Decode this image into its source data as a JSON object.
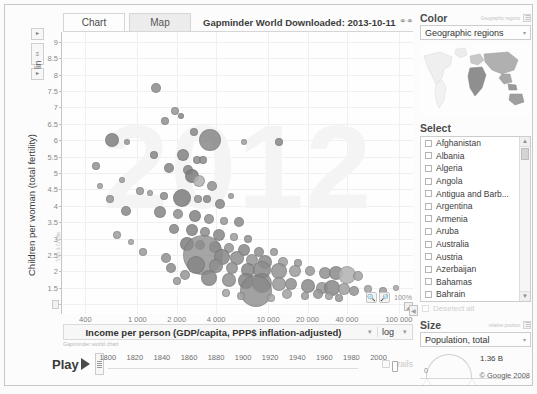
{
  "window": {
    "doc_title": "Gapminder World Downloaded: 2013-10-11",
    "link_icon": "link-icon",
    "copyright": "© Google 2008"
  },
  "tabs": [
    {
      "label": "Chart",
      "name": "tab-chart",
      "active": true
    },
    {
      "label": "Map",
      "name": "tab-map",
      "active": false
    }
  ],
  "yaxis": {
    "title": "Children per woman (total fertility)",
    "scale_label": "lin",
    "ticks": [
      "9",
      "8.5",
      "8",
      "7.5",
      "7",
      "6.5",
      "6",
      "5.5",
      "5",
      "4.5",
      "4",
      "3.5",
      "3",
      "2.5",
      "2",
      "1.5",
      "1"
    ],
    "values": [
      9,
      8.5,
      8,
      7.5,
      7,
      6.5,
      6,
      5.5,
      5,
      4.5,
      4,
      3.5,
      3,
      2.5,
      2,
      1.5,
      1
    ],
    "min": 0.7,
    "max": 9.3,
    "mini_note": "Tools & Credits"
  },
  "xaxis": {
    "title": "Income per person (GDP/capita, PPP$ inflation-adjusted)",
    "scale_label": "log",
    "ticks": [
      "400",
      "1 000",
      "2 000",
      "4 000",
      "10 000",
      "20 000",
      "40 000",
      "100 000"
    ],
    "values": [
      400,
      1000,
      2000,
      4000,
      10000,
      20000,
      40000,
      100000
    ],
    "min": 270,
    "max": 128000
  },
  "zoom_controls": {
    "zoom_in": "+",
    "zoom_out": "−",
    "level": "100%"
  },
  "timeline": {
    "play_label": "Play",
    "note": "Gapminder world chart",
    "years": [
      1800,
      1820,
      1840,
      1860,
      1880,
      1900,
      1920,
      1940,
      1960,
      1980,
      2000
    ],
    "current_year": 2012,
    "range_start": 1800,
    "range_end": 2012,
    "trails_label": "Trails",
    "trails_checked": false
  },
  "sidebar": {
    "color": {
      "title": "Color",
      "hint": "Geographic regions",
      "selected": "Geographic regions",
      "map_name": "world-map-thumbnail"
    },
    "select": {
      "title": "Select",
      "countries": [
        "Afghanistan",
        "Albania",
        "Algeria",
        "Angola",
        "Antigua and Barb...",
        "Argentina",
        "Armenia",
        "Aruba",
        "Australia",
        "Austria",
        "Azerbaijan",
        "Bahamas",
        "Bahrain"
      ],
      "deselect_label": "Deselect all"
    },
    "size": {
      "title": "Size",
      "hint": "relative position",
      "selected": "Population, total",
      "min_label": "0",
      "max_label": "1.36 B"
    }
  },
  "chart_data": {
    "type": "scatter",
    "title": "Gapminder World Downloaded: 2013-10-11",
    "xlabel": "Income per person (GDP/capita, PPP$ inflation-adjusted)",
    "ylabel": "Children per woman (total fertility)",
    "xscale": "log",
    "yscale": "linear",
    "xlim": [
      270,
      128000
    ],
    "ylim": [
      0.7,
      9.3
    ],
    "xticks": [
      400,
      1000,
      2000,
      4000,
      10000,
      20000,
      40000,
      100000
    ],
    "yticks": [
      1,
      1.5,
      2,
      2.5,
      3,
      3.5,
      4,
      4.5,
      5,
      5.5,
      6,
      6.5,
      7,
      7.5,
      8,
      8.5,
      9
    ],
    "grid": true,
    "legend": "Geographic regions",
    "size_encoding": "Population, total",
    "year": 2012,
    "watermark": "2012",
    "points": [
      {
        "x": 1400,
        "y": 7.6,
        "r": 5,
        "c": "#8f8f8f"
      },
      {
        "x": 1950,
        "y": 6.9,
        "r": 4,
        "c": "#9a9a9a"
      },
      {
        "x": 2150,
        "y": 6.75,
        "r": 3,
        "c": "#8a8a8a"
      },
      {
        "x": 1620,
        "y": 6.6,
        "r": 4,
        "c": "#949494"
      },
      {
        "x": 2700,
        "y": 6.25,
        "r": 4,
        "c": "#8d8d8d"
      },
      {
        "x": 640,
        "y": 6.0,
        "r": 7,
        "c": "#848484"
      },
      {
        "x": 830,
        "y": 5.95,
        "r": 3,
        "c": "#9b9b9b"
      },
      {
        "x": 3600,
        "y": 6.0,
        "r": 11,
        "c": "#7e7e7e"
      },
      {
        "x": 6500,
        "y": 5.95,
        "r": 3,
        "c": "#a2a2a2"
      },
      {
        "x": 12000,
        "y": 5.95,
        "r": 4,
        "c": "#8c8c8c"
      },
      {
        "x": 1350,
        "y": 5.55,
        "r": 4,
        "c": "#8b8b8b"
      },
      {
        "x": 2250,
        "y": 5.55,
        "r": 6,
        "c": "#868686"
      },
      {
        "x": 2850,
        "y": 5.4,
        "r": 4,
        "c": "#909090"
      },
      {
        "x": 3150,
        "y": 5.4,
        "r": 4,
        "c": "#8e8e8e"
      },
      {
        "x": 1750,
        "y": 5.15,
        "r": 5,
        "c": "#898989"
      },
      {
        "x": 2450,
        "y": 5.1,
        "r": 5,
        "c": "#8a8a8a"
      },
      {
        "x": 2600,
        "y": 4.9,
        "r": 7,
        "c": "#7f7f7f"
      },
      {
        "x": 2950,
        "y": 4.75,
        "r": 6,
        "c": "#b2b2b2"
      },
      {
        "x": 3700,
        "y": 4.6,
        "r": 5,
        "c": "#949494"
      },
      {
        "x": 1050,
        "y": 4.45,
        "r": 4,
        "c": "#9a9a9a"
      },
      {
        "x": 1250,
        "y": 4.4,
        "r": 3,
        "c": "#a3a3a3"
      },
      {
        "x": 1600,
        "y": 4.3,
        "r": 4,
        "c": "#8f8f8f"
      },
      {
        "x": 2200,
        "y": 4.25,
        "r": 9,
        "c": "#808080"
      },
      {
        "x": 2900,
        "y": 4.2,
        "r": 4,
        "c": "#979797"
      },
      {
        "x": 3400,
        "y": 4.2,
        "r": 4,
        "c": "#8d8d8d"
      },
      {
        "x": 5200,
        "y": 4.3,
        "r": 3,
        "c": "#9f9f9f"
      },
      {
        "x": 4300,
        "y": 4.05,
        "r": 5,
        "c": "#8a8a8a"
      },
      {
        "x": 820,
        "y": 3.85,
        "r": 5,
        "c": "#8c8c8c"
      },
      {
        "x": 1500,
        "y": 3.8,
        "r": 6,
        "c": "#898989"
      },
      {
        "x": 2050,
        "y": 3.75,
        "r": 5,
        "c": "#939393"
      },
      {
        "x": 2750,
        "y": 3.7,
        "r": 6,
        "c": "#858585"
      },
      {
        "x": 3500,
        "y": 3.6,
        "r": 5,
        "c": "#929292"
      },
      {
        "x": 4600,
        "y": 3.55,
        "r": 4,
        "c": "#9c9c9c"
      },
      {
        "x": 6000,
        "y": 3.5,
        "r": 5,
        "c": "#8e8e8e"
      },
      {
        "x": 1900,
        "y": 3.3,
        "r": 5,
        "c": "#8b8b8b"
      },
      {
        "x": 2600,
        "y": 3.25,
        "r": 6,
        "c": "#878787"
      },
      {
        "x": 3300,
        "y": 3.2,
        "r": 5,
        "c": "#909090"
      },
      {
        "x": 4200,
        "y": 3.1,
        "r": 6,
        "c": "#8a8a8a"
      },
      {
        "x": 5500,
        "y": 3.05,
        "r": 4,
        "c": "#a0a0a0"
      },
      {
        "x": 7000,
        "y": 3.0,
        "r": 4,
        "c": "#959595"
      },
      {
        "x": 2400,
        "y": 2.85,
        "r": 7,
        "c": "#828282"
      },
      {
        "x": 3000,
        "y": 2.8,
        "r": 5,
        "c": "#8f8f8f"
      },
      {
        "x": 3900,
        "y": 2.75,
        "r": 6,
        "c": "#8c8c8c"
      },
      {
        "x": 5000,
        "y": 2.7,
        "r": 5,
        "c": "#979797"
      },
      {
        "x": 6500,
        "y": 2.65,
        "r": 6,
        "c": "#8b8b8b"
      },
      {
        "x": 8500,
        "y": 2.6,
        "r": 5,
        "c": "#939393"
      },
      {
        "x": 11000,
        "y": 2.6,
        "r": 4,
        "c": "#9d9d9d"
      },
      {
        "x": 3200,
        "y": 2.5,
        "r": 20,
        "c": "#8d8d8d"
      },
      {
        "x": 4400,
        "y": 2.45,
        "r": 8,
        "c": "#8a8a8a"
      },
      {
        "x": 5800,
        "y": 2.4,
        "r": 7,
        "c": "#919191"
      },
      {
        "x": 7500,
        "y": 2.35,
        "r": 6,
        "c": "#999999"
      },
      {
        "x": 9500,
        "y": 2.3,
        "r": 7,
        "c": "#8e8e8e"
      },
      {
        "x": 13000,
        "y": 2.3,
        "r": 5,
        "c": "#a1a1a1"
      },
      {
        "x": 17000,
        "y": 2.25,
        "r": 4,
        "c": "#9a9a9a"
      },
      {
        "x": 2800,
        "y": 2.2,
        "r": 9,
        "c": "#878787"
      },
      {
        "x": 4000,
        "y": 2.15,
        "r": 7,
        "c": "#8f8f8f"
      },
      {
        "x": 5300,
        "y": 2.1,
        "r": 6,
        "c": "#949494"
      },
      {
        "x": 7000,
        "y": 2.05,
        "r": 7,
        "c": "#8b8b8b"
      },
      {
        "x": 9000,
        "y": 2.05,
        "r": 9,
        "c": "#8d8d8d"
      },
      {
        "x": 12000,
        "y": 2.0,
        "r": 8,
        "c": "#969696"
      },
      {
        "x": 16000,
        "y": 2.0,
        "r": 6,
        "c": "#a0a0a0"
      },
      {
        "x": 21000,
        "y": 2.0,
        "r": 5,
        "c": "#9c9c9c"
      },
      {
        "x": 27000,
        "y": 1.95,
        "r": 6,
        "c": "#949494"
      },
      {
        "x": 33000,
        "y": 1.95,
        "r": 7,
        "c": "#8f8f8f"
      },
      {
        "x": 40000,
        "y": 1.9,
        "r": 9,
        "c": "#b4b4b4"
      },
      {
        "x": 49000,
        "y": 1.85,
        "r": 5,
        "c": "#a4a4a4"
      },
      {
        "x": 3500,
        "y": 1.8,
        "r": 8,
        "c": "#8a8a8a"
      },
      {
        "x": 5000,
        "y": 1.75,
        "r": 7,
        "c": "#929292"
      },
      {
        "x": 6800,
        "y": 1.7,
        "r": 8,
        "c": "#888888"
      },
      {
        "x": 9000,
        "y": 1.65,
        "r": 10,
        "c": "#858585"
      },
      {
        "x": 12000,
        "y": 1.6,
        "r": 7,
        "c": "#9b9b9b"
      },
      {
        "x": 15000,
        "y": 1.6,
        "r": 6,
        "c": "#939393"
      },
      {
        "x": 20000,
        "y": 1.55,
        "r": 7,
        "c": "#8e8e8e"
      },
      {
        "x": 26000,
        "y": 1.5,
        "r": 6,
        "c": "#999999"
      },
      {
        "x": 31000,
        "y": 1.5,
        "r": 8,
        "c": "#8c8c8c"
      },
      {
        "x": 38000,
        "y": 1.45,
        "r": 6,
        "c": "#a2a2a2"
      },
      {
        "x": 45000,
        "y": 1.4,
        "r": 5,
        "c": "#979797"
      },
      {
        "x": 8000,
        "y": 1.4,
        "r": 16,
        "c": "#898989"
      },
      {
        "x": 58000,
        "y": 1.45,
        "r": 4,
        "c": "#a6a6a6"
      },
      {
        "x": 75000,
        "y": 1.4,
        "r": 4,
        "c": "#9e9e9e"
      },
      {
        "x": 95000,
        "y": 1.5,
        "r": 3,
        "c": "#acacac"
      },
      {
        "x": 1100,
        "y": 2.6,
        "r": 4,
        "c": "#9e9e9e"
      },
      {
        "x": 1650,
        "y": 2.4,
        "r": 5,
        "c": "#949494"
      },
      {
        "x": 700,
        "y": 3.1,
        "r": 4,
        "c": "#a0a0a0"
      },
      {
        "x": 900,
        "y": 2.9,
        "r": 3,
        "c": "#a8a8a8"
      },
      {
        "x": 480,
        "y": 5.2,
        "r": 4,
        "c": "#969696"
      },
      {
        "x": 520,
        "y": 4.6,
        "r": 3,
        "c": "#a4a4a4"
      },
      {
        "x": 620,
        "y": 4.2,
        "r": 4,
        "c": "#9a9a9a"
      },
      {
        "x": 760,
        "y": 4.8,
        "r": 3,
        "c": "#a1a1a1"
      },
      {
        "x": 1800,
        "y": 2.1,
        "r": 5,
        "c": "#909090"
      },
      {
        "x": 2300,
        "y": 1.9,
        "r": 5,
        "c": "#989898"
      },
      {
        "x": 2000,
        "y": 1.7,
        "r": 4,
        "c": "#9d9d9d"
      },
      {
        "x": 14000,
        "y": 1.3,
        "r": 5,
        "c": "#a5a5a5"
      },
      {
        "x": 19000,
        "y": 1.25,
        "r": 4,
        "c": "#9f9f9f"
      },
      {
        "x": 24000,
        "y": 1.3,
        "r": 5,
        "c": "#979797"
      },
      {
        "x": 29000,
        "y": 1.25,
        "r": 4,
        "c": "#a3a3a3"
      },
      {
        "x": 35000,
        "y": 1.2,
        "r": 4,
        "c": "#9b9b9b"
      },
      {
        "x": 10500,
        "y": 1.2,
        "r": 4,
        "c": "#a9a9a9"
      },
      {
        "x": 6200,
        "y": 1.25,
        "r": 4,
        "c": "#a2a2a2"
      },
      {
        "x": 4800,
        "y": 1.35,
        "r": 4,
        "c": "#a6a6a6"
      }
    ]
  }
}
